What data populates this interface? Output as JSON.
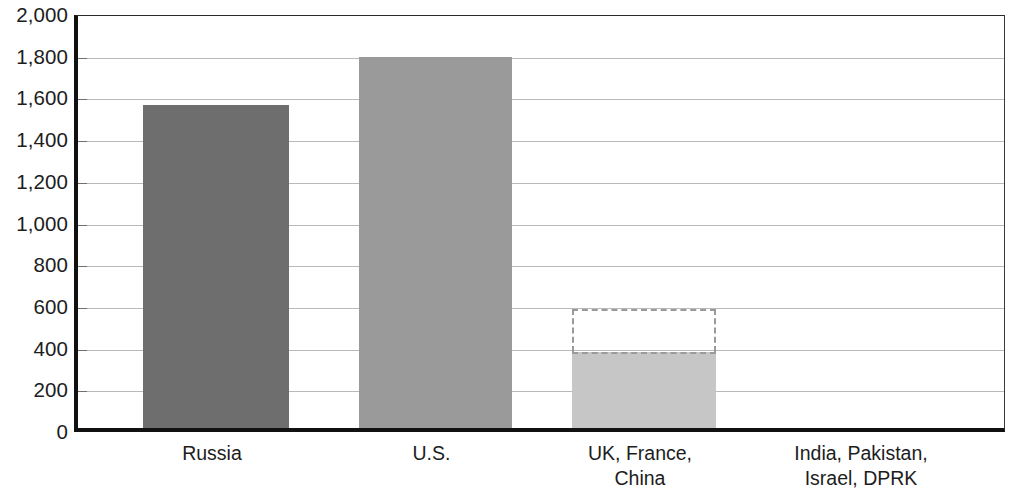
{
  "chart_data": {
    "type": "bar",
    "title": "",
    "subtitle": "",
    "xlabel": "",
    "ylabel": "",
    "ylim": [
      0,
      2000
    ],
    "ytick_step": 200,
    "grid": true,
    "legend": false,
    "categories": [
      "Russia",
      "U.S.",
      "UK, France, China",
      "India, Pakistan, Israel, DPRK"
    ],
    "category_lines": [
      [
        "Russia"
      ],
      [
        "U.S."
      ],
      [
        "UK, France,",
        "China"
      ],
      [
        "India, Pakistan,",
        "Israel, DPRK"
      ]
    ],
    "ytick_labels": [
      "2,000",
      "1,800",
      "1,600",
      "1,400",
      "1,200",
      "1,000",
      "800",
      "600",
      "400",
      "200",
      "0"
    ],
    "ytick_values": [
      2000,
      1800,
      1600,
      1400,
      1200,
      1000,
      800,
      600,
      400,
      200,
      0
    ],
    "series": [
      {
        "name": "Deployed",
        "values": [
          1550,
          1780,
          365,
          0
        ],
        "style": "solid"
      },
      {
        "name": "Additional (estimated)",
        "values": [
          0,
          0,
          205,
          0
        ],
        "style": "dashed-outline"
      }
    ],
    "bar_totals": [
      1550,
      1780,
      570,
      0
    ],
    "bar_colors": [
      "#6e6e6e",
      "#9a9a9a",
      "#c6c6c6",
      "#ffffff"
    ],
    "dashed_outline_color": "#9a9a9a",
    "annotations": []
  },
  "axis": {
    "frame_color": "#111111",
    "gridline_color": "#b9b9b9",
    "tick_color": "#6f6f6f",
    "text_color": "#1d1d1d"
  }
}
